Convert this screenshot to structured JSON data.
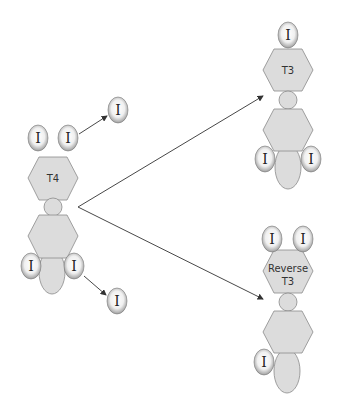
{
  "diagram": {
    "molecules": {
      "t4": {
        "label": "T4"
      },
      "t3": {
        "label": "T3"
      },
      "reverse_t3": {
        "label_line1": "Reverse",
        "label_line2": "T3"
      }
    },
    "iodine_symbol": "I",
    "colors": {
      "ring_fill": "#dcdcdc",
      "ring_stroke": "#8a8a8a",
      "arrow": "#333333",
      "background": "#ffffff"
    }
  }
}
